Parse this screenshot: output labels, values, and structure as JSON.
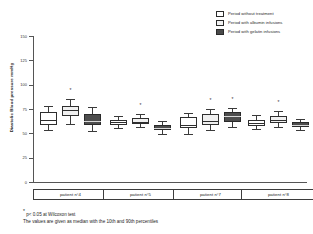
{
  "legend": {
    "items": [
      {
        "key": "none",
        "label": "Period without treatment",
        "color": "#ffffff"
      },
      {
        "key": "alb",
        "label": "Period with albumin infusions",
        "color": "#f2f2f2"
      },
      {
        "key": "gel",
        "label": "Period with gelatin infusions",
        "color": "#4a4a4a"
      }
    ]
  },
  "footnotes": {
    "line1_star": "*",
    "line1": " p< 0.05 at Wilcoxon test",
    "line2": "The values are given as median with the 10th and 90th percentiles"
  },
  "chart_data": {
    "type": "box",
    "title": "",
    "xlabel": "",
    "ylabel": "Diastolic Blood pressure mmHg",
    "ylim": [
      0,
      150
    ],
    "yticks": [
      0,
      25,
      50,
      75,
      100,
      125,
      150
    ],
    "ytick_labels": [
      "0",
      "25",
      "50",
      "75",
      "100",
      "125",
      "150"
    ],
    "grid": false,
    "legend_position": "top-right",
    "categories": [
      "patient n°4",
      "patient n°5",
      "patient n°7",
      "patient n°8"
    ],
    "series": [
      {
        "name": "Period without treatment",
        "key": "none"
      },
      {
        "name": "Period with albumin infusions",
        "key": "alb"
      },
      {
        "name": "Period with gelatin infusions",
        "key": "gel"
      }
    ],
    "boxes": [
      {
        "group": "patient n°4",
        "series": "none",
        "p10": 53,
        "q1": 59,
        "median": 64,
        "q3": 72,
        "p90": 78,
        "significant": false
      },
      {
        "group": "patient n°4",
        "series": "alb",
        "p10": 60,
        "q1": 68,
        "median": 74,
        "q3": 78,
        "p90": 85,
        "significant": true
      },
      {
        "group": "patient n°4",
        "series": "gel",
        "p10": 52,
        "q1": 59,
        "median": 63,
        "q3": 70,
        "p90": 77,
        "significant": false
      },
      {
        "group": "patient n°5",
        "series": "none",
        "p10": 55,
        "q1": 59,
        "median": 62,
        "q3": 64,
        "p90": 68,
        "significant": false
      },
      {
        "group": "patient n°5",
        "series": "alb",
        "p10": 56,
        "q1": 60,
        "median": 62,
        "q3": 66,
        "p90": 70,
        "significant": true
      },
      {
        "group": "patient n°5",
        "series": "gel",
        "p10": 49,
        "q1": 53,
        "median": 55,
        "q3": 59,
        "p90": 63,
        "significant": false
      },
      {
        "group": "patient n°7",
        "series": "none",
        "p10": 49,
        "q1": 55,
        "median": 59,
        "q3": 67,
        "p90": 71,
        "significant": false
      },
      {
        "group": "patient n°7",
        "series": "alb",
        "p10": 53,
        "q1": 59,
        "median": 63,
        "q3": 70,
        "p90": 75,
        "significant": true
      },
      {
        "group": "patient n°7",
        "series": "gel",
        "p10": 56,
        "q1": 62,
        "median": 68,
        "q3": 72,
        "p90": 76,
        "significant": true
      },
      {
        "group": "patient n°8",
        "series": "none",
        "p10": 54,
        "q1": 58,
        "median": 61,
        "q3": 64,
        "p90": 69,
        "significant": false
      },
      {
        "group": "patient n°8",
        "series": "alb",
        "p10": 56,
        "q1": 61,
        "median": 64,
        "q3": 68,
        "p90": 73,
        "significant": true
      },
      {
        "group": "patient n°8",
        "series": "gel",
        "p10": 53,
        "q1": 57,
        "median": 59,
        "q3": 62,
        "p90": 65,
        "significant": false
      }
    ]
  }
}
